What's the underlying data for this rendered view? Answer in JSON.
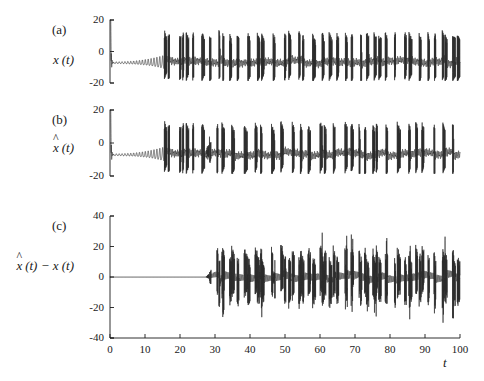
{
  "figure": {
    "background_color": "#ffffff",
    "trace_color": "#2b2b2b",
    "axis_color": "#1a1a1a",
    "xaxis_label": "t"
  },
  "panels": [
    {
      "tag": "(a)",
      "ylabel_prefix": "x",
      "ylabel_hat": false,
      "ylabel_suffix": "(t)",
      "yticks": [
        "20",
        "0",
        "-20"
      ],
      "ylim": [
        -20,
        20
      ],
      "xlim": [
        0,
        100
      ],
      "show_xticks": false
    },
    {
      "tag": "(b)",
      "ylabel_prefix": "x",
      "ylabel_hat": true,
      "ylabel_suffix": "(t)",
      "yticks": [
        "20",
        "0",
        "-20"
      ],
      "ylim": [
        -20,
        20
      ],
      "xlim": [
        0,
        100
      ],
      "show_xticks": false
    },
    {
      "tag": "(c)",
      "ylabel_prefix": "x",
      "ylabel_hat": true,
      "ylabel_suffix": "(t) − x (t)",
      "yticks": [
        "40",
        "20",
        "0",
        "-20",
        "-40"
      ],
      "ylim": [
        -40,
        40
      ],
      "xlim": [
        0,
        100
      ],
      "show_xticks": true
    }
  ],
  "xticks": [
    "0",
    "10",
    "20",
    "30",
    "40",
    "50",
    "60",
    "70",
    "80",
    "90",
    "100"
  ],
  "chart_data": {
    "type": "line",
    "title": "",
    "xlabel": "t",
    "ylabel": "",
    "n_panels": 3,
    "x": {
      "min": 0,
      "max": 100,
      "tick_step": 10
    },
    "series": [
      {
        "name": "x(t)",
        "panel": "(a)",
        "ylim": [
          -20,
          20
        ],
        "ytick_step": 20,
        "description": "Chaotic bursting oscillator state. Initial transient spike to +20 near t=0, then small-amplitude damped oscillation about a baseline near -7 that slowly grows in amplitude from t~1 to t~15, followed by sustained chaotic spike-burst activity with spikes reaching +18 and troughs to -18 for the remainder of the record."
      },
      {
        "name": "x-hat(t)",
        "panel": "(b)",
        "ylim": [
          -20,
          20
        ],
        "ytick_step": 20,
        "description": "Observer / estimator state. Visually near-identical structure to x(t): initial spike to +20, damped small oscillation about -7 growing through t~15, then chaotic bursting to +/-18. Trajectory tracks x(t) closely until roughly t=28, after which the two diverge."
      },
      {
        "name": "x-hat(t) - x(t)",
        "panel": "(c)",
        "ylim": [
          -40,
          40
        ],
        "ytick_step": 20,
        "description": "Synchronization error. Exactly flat at 0 from t=0 to about t=27. Small ripples appear near t=27-30, then the error grows rapidly into broadband chaotic fluctuation spanning roughly -32 to +30 for the rest of the record, with the largest positive excursion near t=33 (~+30) and large negative excursions near t=38 and t=85 (~-32)."
      }
    ],
    "grid": false,
    "legend": null,
    "annotations": [
      "(a)",
      "(b)",
      "(c)"
    ]
  }
}
